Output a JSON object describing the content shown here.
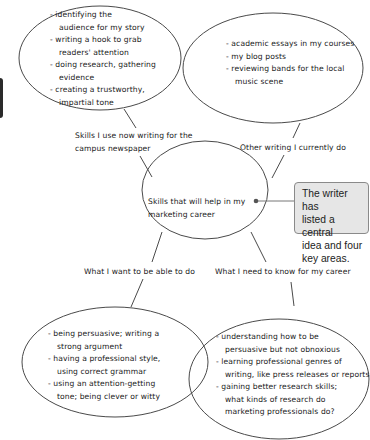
{
  "diagram": {
    "type": "mind-map",
    "center": {
      "lines": [
        "Skills that will help in my",
        "marketing career"
      ]
    },
    "branches": [
      {
        "label_lines": [
          "Skills I use now writing for the",
          "campus newspaper"
        ],
        "items": [
          [
            "- identifying the",
            "audience for my story"
          ],
          [
            "- writing a hook to grab",
            "readers' attention"
          ],
          [
            "- doing research, gathering",
            "evidence"
          ],
          [
            "- creating a trustworthy,",
            "impartial tone"
          ]
        ]
      },
      {
        "label_lines": [
          "Other writing I currently do"
        ],
        "items": [
          [
            "- academic essays in my courses"
          ],
          [
            "- my blog posts"
          ],
          [
            "- reviewing bands for the local",
            "music scene"
          ]
        ]
      },
      {
        "label_lines": [
          "What I want to be able to do"
        ],
        "items": [
          [
            "- being persuasive; writing a",
            "strong argument"
          ],
          [
            "- having a professional style,",
            "using correct grammar"
          ],
          [
            "- using an attention-getting",
            "tone; being clever or witty"
          ]
        ]
      },
      {
        "label_lines": [
          "What I need to know for my career"
        ],
        "items": [
          [
            "- understanding how to be",
            "persuasive but not obnoxious"
          ],
          [
            "- learning professional genres of",
            "writing, like press releases or reports"
          ],
          [
            "- gaining better research skills;",
            "what kinds of research do",
            "marketing professionals do?"
          ]
        ]
      }
    ],
    "callout": {
      "lines": [
        "The writer has",
        "listed a central",
        "idea and four",
        "key areas."
      ]
    },
    "colors": {
      "ink": "#1a1a1a",
      "outline": "#4a4a4a",
      "callout_bg": "#e6e6e6",
      "callout_border": "#8a8a8a"
    }
  }
}
